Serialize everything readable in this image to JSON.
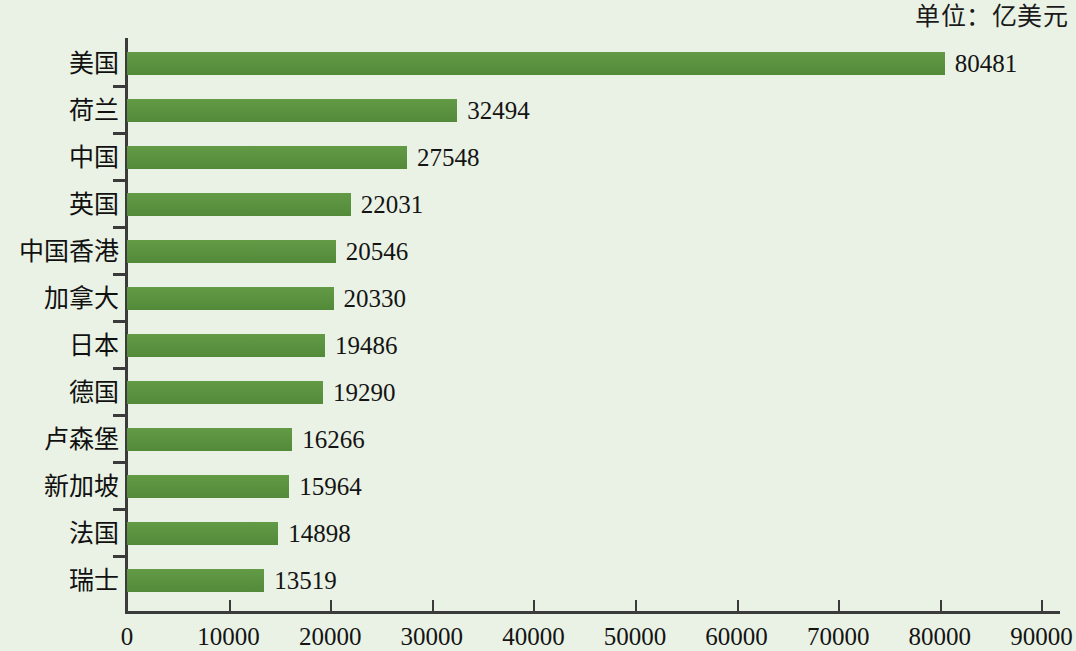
{
  "caption": {
    "unit_label": "单位：亿美元"
  },
  "chart_data": {
    "type": "bar",
    "orientation": "horizontal",
    "title": "",
    "subtitle": "",
    "unit_note": "单位：亿美元",
    "xlabel": "",
    "ylabel": "",
    "xlim": [
      0,
      90000
    ],
    "xticks": [
      0,
      10000,
      20000,
      30000,
      40000,
      50000,
      60000,
      70000,
      80000,
      90000
    ],
    "xtick_labels": [
      "0",
      "10000",
      "20000",
      "30000",
      "40000",
      "50000",
      "60000",
      "70000",
      "80000",
      "90000"
    ],
    "grid": false,
    "legend": "none",
    "bar_color": "#5d9440",
    "background_color": "#e9f2e4",
    "axis_color": "#3b3b3b",
    "categories": [
      "美国",
      "荷兰",
      "中国",
      "英国",
      "中国香港",
      "加拿大",
      "日本",
      "德国",
      "卢森堡",
      "新加坡",
      "法国",
      "瑞士"
    ],
    "values": [
      80481,
      32494,
      27548,
      22031,
      20546,
      20330,
      19486,
      19290,
      16266,
      15964,
      14898,
      13519
    ],
    "value_labels": [
      "80481",
      "32494",
      "27548",
      "22031",
      "20546",
      "20330",
      "19486",
      "19290",
      "16266",
      "15964",
      "14898",
      "13519"
    ]
  }
}
